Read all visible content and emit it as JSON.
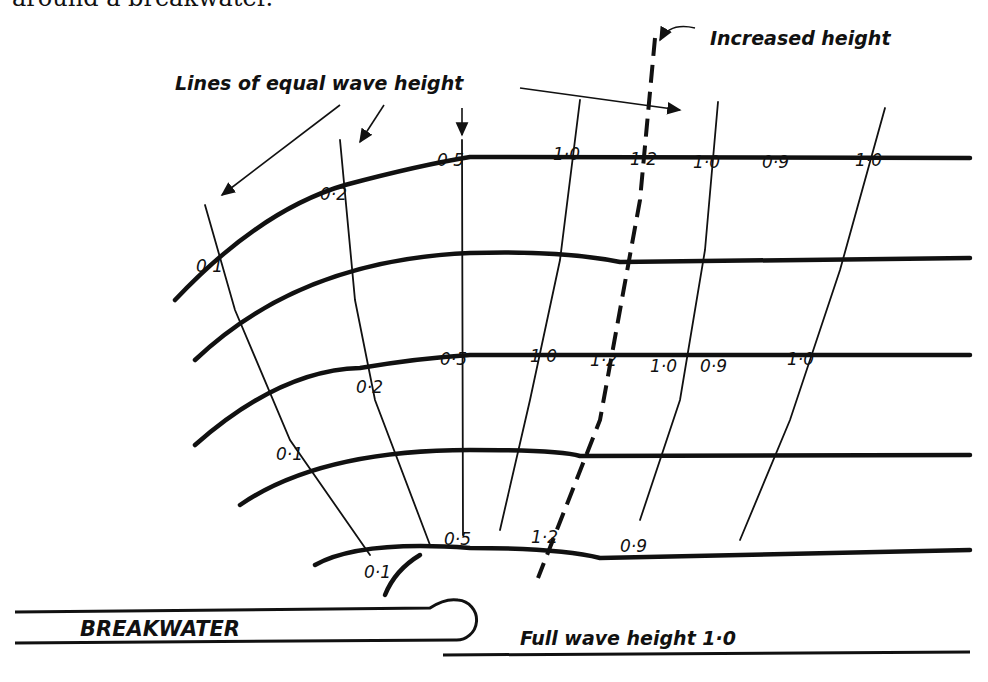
{
  "caption": "around a breakwater.",
  "annotations": {
    "increased_height": "Increased height",
    "equal_lines": "Lines of equal wave height",
    "breakwater": "BREAKWATER",
    "full_wave": "Full wave height 1·0"
  },
  "rows": {
    "top": [
      "0·1",
      "0·2",
      "0·5",
      "1·0",
      "1·2",
      "1·0",
      "0·9",
      "1·0"
    ],
    "middle": [
      "0·1",
      "0·2",
      "0·5",
      "1·0",
      "1·2",
      "1·0",
      "0·9",
      "1·0"
    ],
    "bottom": [
      "0·1",
      "0·5",
      "1·2",
      "0·9"
    ]
  },
  "colors": {
    "ink": "#111111",
    "paper": "#ffffff"
  }
}
